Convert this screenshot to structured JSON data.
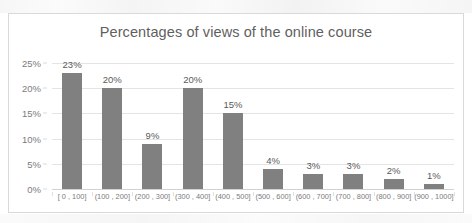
{
  "chart_data": {
    "type": "bar",
    "title": "Percentages of views of the online course",
    "xlabel": "",
    "ylabel": "",
    "categories": [
      "[ 0 , 100]",
      "(100 , 200]",
      "(200 , 300]",
      "(300 , 400]",
      "(400 , 500]",
      "(500 , 600]",
      "(600 , 700]",
      "(700 , 800]",
      "(800 , 900]",
      "(900 , 1000]"
    ],
    "values": [
      23,
      20,
      9,
      20,
      15,
      4,
      3,
      3,
      2,
      1
    ],
    "data_labels": [
      "23%",
      "20%",
      "9%",
      "20%",
      "15%",
      "4%",
      "3%",
      "3%",
      "2%",
      "1%"
    ],
    "ytick_labels": [
      "0%",
      "5%",
      "10%",
      "15%",
      "20%",
      "25%"
    ],
    "ytick_values": [
      0,
      5,
      10,
      15,
      20,
      25
    ],
    "ylim": [
      0,
      25
    ],
    "grid": true,
    "legend": false,
    "bar_color": "#808080",
    "title_color": "#5f5f5f",
    "gridline_color": "#e4e4e4",
    "axis_text_color": "#7b7b7b",
    "frame_color": "#d9d9d9"
  }
}
